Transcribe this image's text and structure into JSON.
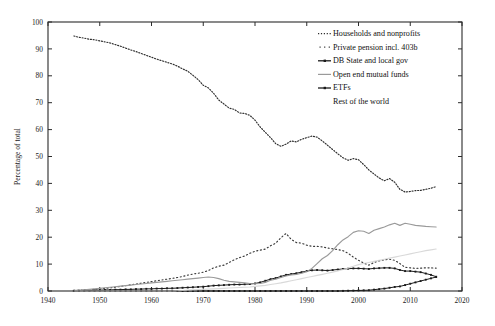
{
  "chart_data": {
    "type": "line",
    "title": "",
    "xlabel": "",
    "ylabel": "Percentage of total",
    "xlim": [
      1940,
      2020
    ],
    "ylim": [
      0,
      100
    ],
    "xticks": [
      1940,
      1950,
      1960,
      1970,
      1980,
      1990,
      2000,
      2010,
      2020
    ],
    "yticks": [
      0,
      10,
      20,
      30,
      40,
      50,
      60,
      70,
      80,
      90,
      100
    ],
    "grid": false,
    "legend_position": "upper-right",
    "x": [
      1945,
      1946,
      1947,
      1948,
      1949,
      1950,
      1951,
      1952,
      1953,
      1954,
      1955,
      1956,
      1957,
      1958,
      1959,
      1960,
      1961,
      1962,
      1963,
      1964,
      1965,
      1966,
      1967,
      1968,
      1969,
      1970,
      1971,
      1972,
      1973,
      1974,
      1975,
      1976,
      1977,
      1978,
      1979,
      1980,
      1981,
      1982,
      1983,
      1984,
      1985,
      1986,
      1987,
      1988,
      1989,
      1990,
      1991,
      1992,
      1993,
      1994,
      1995,
      1996,
      1997,
      1998,
      1999,
      2000,
      2001,
      2002,
      2003,
      2004,
      2005,
      2006,
      2007,
      2008,
      2009,
      2010,
      2011,
      2012,
      2013,
      2014,
      2015
    ],
    "series": [
      {
        "name": "Households and nonprofits",
        "style": "dotted",
        "color": "#2e2e2e",
        "values": [
          94.8,
          94.3,
          94.0,
          93.6,
          93.4,
          93.0,
          92.6,
          92.2,
          91.6,
          91.0,
          90.3,
          89.6,
          89.0,
          88.3,
          87.6,
          86.9,
          86.2,
          85.6,
          85.0,
          84.4,
          83.6,
          82.6,
          81.7,
          80.2,
          78.6,
          76.5,
          75.5,
          73.5,
          71.0,
          69.5,
          68.0,
          67.5,
          66.2,
          66.0,
          65.3,
          63.5,
          61.0,
          59.0,
          57.0,
          54.8,
          53.8,
          54.6,
          55.8,
          55.4,
          56.4,
          57.0,
          57.6,
          57.2,
          55.8,
          54.2,
          52.6,
          51.0,
          49.5,
          48.6,
          49.2,
          48.8,
          47.0,
          45.0,
          43.5,
          42.0,
          41.0,
          41.8,
          40.4,
          37.8,
          36.8,
          37.0,
          37.3,
          37.4,
          37.8,
          38.2,
          38.8
        ]
      },
      {
        "name": "Private pension incl. 403b",
        "style": "dotted-sparse",
        "color": "#3a3a3a",
        "values": [
          0.2,
          0.3,
          0.4,
          0.5,
          0.6,
          0.8,
          1.0,
          1.2,
          1.4,
          1.7,
          2.0,
          2.3,
          2.6,
          2.9,
          3.2,
          3.5,
          3.8,
          4.1,
          4.4,
          4.7,
          5.0,
          5.4,
          5.9,
          6.3,
          6.6,
          7.0,
          7.6,
          8.6,
          9.2,
          9.6,
          10.6,
          11.6,
          12.4,
          13.0,
          14.0,
          14.8,
          15.2,
          15.6,
          16.8,
          17.8,
          19.8,
          21.4,
          19.2,
          18.0,
          17.8,
          17.0,
          16.6,
          16.6,
          16.4,
          16.0,
          15.7,
          15.4,
          15.0,
          14.0,
          12.6,
          11.4,
          10.4,
          9.6,
          10.6,
          11.2,
          11.6,
          11.8,
          11.4,
          10.2,
          8.8,
          8.6,
          8.4,
          8.5,
          8.6,
          8.6,
          8.5
        ]
      },
      {
        "name": "DB State and local gov",
        "style": "line-marker",
        "color": "#1b1b1b",
        "values": [
          0.1,
          0.1,
          0.2,
          0.2,
          0.3,
          0.3,
          0.4,
          0.4,
          0.5,
          0.5,
          0.6,
          0.6,
          0.7,
          0.7,
          0.8,
          0.8,
          0.9,
          0.9,
          1.0,
          1.0,
          1.1,
          1.2,
          1.3,
          1.4,
          1.5,
          1.6,
          1.8,
          2.0,
          2.1,
          2.2,
          2.3,
          2.4,
          2.4,
          2.5,
          2.6,
          2.8,
          3.2,
          3.8,
          4.4,
          4.8,
          5.4,
          6.0,
          6.3,
          6.6,
          7.0,
          7.4,
          7.7,
          7.8,
          7.7,
          7.6,
          7.8,
          8.0,
          8.2,
          8.3,
          8.4,
          8.4,
          8.3,
          8.2,
          8.4,
          8.5,
          8.6,
          8.6,
          8.4,
          7.8,
          7.4,
          7.4,
          7.2,
          7.0,
          6.5,
          6.0,
          5.3
        ]
      },
      {
        "name": "Open end mutual funds",
        "style": "solid",
        "color": "#9a9a9a",
        "values": [
          0.2,
          0.3,
          0.4,
          0.6,
          0.8,
          1.0,
          1.2,
          1.4,
          1.6,
          1.8,
          2.0,
          2.2,
          2.4,
          2.6,
          2.8,
          3.0,
          3.2,
          3.4,
          3.6,
          3.8,
          4.0,
          4.2,
          4.4,
          4.6,
          4.8,
          5.0,
          5.2,
          5.0,
          4.6,
          4.0,
          3.6,
          3.4,
          3.2,
          3.0,
          2.8,
          2.7,
          2.8,
          3.2,
          4.0,
          4.4,
          5.0,
          5.6,
          6.0,
          6.2,
          6.6,
          7.2,
          8.4,
          10.2,
          12.0,
          13.2,
          15.0,
          17.2,
          19.0,
          20.2,
          21.8,
          22.4,
          22.2,
          21.4,
          22.6,
          23.2,
          23.8,
          24.6,
          25.2,
          24.4,
          25.2,
          24.8,
          24.4,
          24.2,
          24.0,
          23.9,
          23.8
        ]
      },
      {
        "name": "ETFs",
        "style": "line-marker",
        "color": "#1b1b1b",
        "values": [
          0,
          0,
          0,
          0,
          0,
          0,
          0,
          0,
          0,
          0,
          0,
          0,
          0,
          0,
          0,
          0,
          0,
          0,
          0,
          0,
          0,
          0,
          0,
          0,
          0,
          0,
          0,
          0,
          0,
          0,
          0,
          0,
          0,
          0,
          0,
          0,
          0,
          0,
          0,
          0,
          0,
          0,
          0,
          0,
          0,
          0,
          0,
          0,
          0,
          0,
          0,
          0,
          0.05,
          0.1,
          0.15,
          0.2,
          0.25,
          0.3,
          0.5,
          0.7,
          0.9,
          1.2,
          1.5,
          1.7,
          2.2,
          2.7,
          3.2,
          3.7,
          4.2,
          4.7,
          5.2
        ]
      },
      {
        "name": "Rest of the world",
        "style": "solid-faint",
        "color": "#d2d2d2",
        "values": [
          0,
          0,
          0,
          0,
          0,
          0,
          0,
          0,
          0,
          0,
          0,
          0,
          0,
          0,
          0,
          0,
          0,
          0,
          0,
          0,
          0.1,
          0.2,
          0.3,
          0.4,
          0.5,
          0.6,
          0.7,
          0.8,
          0.9,
          1.0,
          1.1,
          1.2,
          1.3,
          1.4,
          1.5,
          1.7,
          1.9,
          2.1,
          2.4,
          2.7,
          3.0,
          3.4,
          3.8,
          4.2,
          4.6,
          5.0,
          5.4,
          5.8,
          6.2,
          6.6,
          7.0,
          7.5,
          8.0,
          8.5,
          9.2,
          9.8,
          10.2,
          10.6,
          11.0,
          11.4,
          11.8,
          12.2,
          12.6,
          13.0,
          13.4,
          13.8,
          14.2,
          14.6,
          15.0,
          15.3,
          15.6
        ]
      }
    ]
  },
  "axis": {
    "ylabel": "Percentage of total",
    "ytick_labels": [
      "0",
      "10",
      "20",
      "30",
      "40",
      "50",
      "60",
      "70",
      "80",
      "90",
      "100"
    ],
    "xtick_labels": [
      "1940",
      "1950",
      "1960",
      "1970",
      "1980",
      "1990",
      "2000",
      "2010",
      "2020"
    ]
  },
  "legend": {
    "entries": [
      {
        "label": "Households and nonprofits",
        "marker": "dotted-swatch"
      },
      {
        "label": "Private pension incl. 403b",
        "marker": "dotted-sparse-swatch"
      },
      {
        "label": "DB State and local gov",
        "marker": "line-marker-swatch"
      },
      {
        "label": "Open end mutual funds",
        "marker": "solid-swatch"
      },
      {
        "label": "ETFs",
        "marker": "line-marker-swatch"
      },
      {
        "label": "Rest of the world",
        "marker": "none"
      }
    ]
  }
}
